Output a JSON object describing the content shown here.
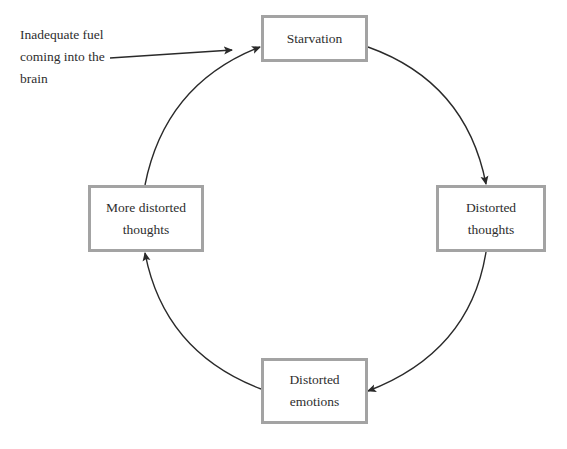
{
  "diagram": {
    "type": "cycle",
    "annotation": {
      "text": "Inadequate fuel\ncoming into the\nbrain",
      "points_to": "starvation"
    },
    "nodes": [
      {
        "id": "starvation",
        "label": "Starvation"
      },
      {
        "id": "distorted-thoughts",
        "label": "Distorted\nthoughts"
      },
      {
        "id": "distorted-emotions",
        "label": "Distorted\nemotions"
      },
      {
        "id": "more-distorted-thoughts",
        "label": "More distorted\nthoughts"
      }
    ],
    "edges": [
      {
        "from": "starvation",
        "to": "distorted-thoughts"
      },
      {
        "from": "distorted-thoughts",
        "to": "distorted-emotions"
      },
      {
        "from": "distorted-emotions",
        "to": "more-distorted-thoughts"
      },
      {
        "from": "more-distorted-thoughts",
        "to": "starvation"
      }
    ],
    "colors": {
      "box_border": "#a3a3a3",
      "arrow": "#2a2a2a",
      "text": "#2e2e2e"
    }
  }
}
